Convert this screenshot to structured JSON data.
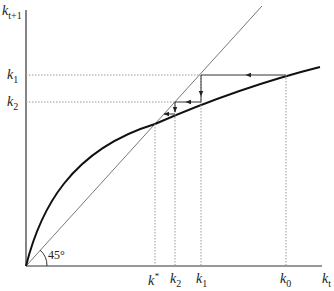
{
  "diagram": {
    "y_axis_label": {
      "base": "k",
      "sub": "t+1"
    },
    "x_axis_label": {
      "base": "k",
      "sub": "t"
    },
    "angle_label": "45°",
    "y_ticks": [
      {
        "base": "k",
        "sub": "1"
      },
      {
        "base": "k",
        "sub": "2"
      }
    ],
    "x_ticks": [
      {
        "base": "k",
        "sub": "*",
        "name": "steady-state"
      },
      {
        "base": "k",
        "sub": "2"
      },
      {
        "base": "k",
        "sub": "1"
      },
      {
        "base": "k",
        "sub": "0"
      }
    ],
    "elements": [
      "45-degree line",
      "concave accumulation curve",
      "cobweb arrows converging from k0 to k*"
    ],
    "colors": {
      "curve": "#111111",
      "line45": "#777777",
      "dotted": "#999999",
      "arrows": "#333333"
    }
  }
}
